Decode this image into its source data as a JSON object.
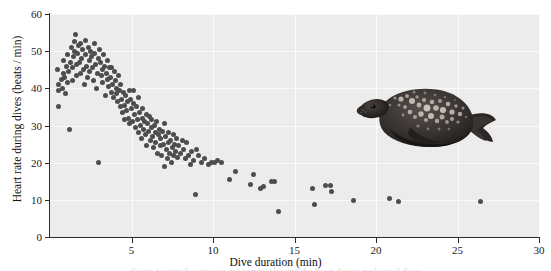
{
  "figure": {
    "title": "",
    "seal_alt": "weddell-seal-illustration",
    "caption_sliver": "diving mammals conserve oxygen by slowing the heart during prolonged dives"
  },
  "axes": {
    "x_title": "Dive duration (min)",
    "y_title": "Heart rate during dives (beats / min)",
    "x_ticks": [
      "5",
      "10",
      "15",
      "20",
      "25",
      "30"
    ],
    "y_ticks": [
      "60",
      "50",
      "40",
      "30",
      "20",
      "10",
      "0"
    ]
  },
  "colors": {
    "panel_background": "#ececec",
    "gridline": "#fafafa",
    "point": "#4d4d4d",
    "axis": "#2b2b2b",
    "text": "#1a1a1a",
    "page_background": "#ffffff"
  },
  "chart_data": {
    "type": "scatter",
    "title": "",
    "xlabel": "Dive duration (min)",
    "ylabel": "Heart rate during dives (beats / min)",
    "xlim": [
      0,
      30
    ],
    "ylim": [
      0,
      60
    ],
    "xticks": [
      5,
      10,
      15,
      20,
      25,
      30
    ],
    "yticks": [
      0,
      10,
      20,
      30,
      40,
      50,
      60
    ],
    "grid": true,
    "legend": null,
    "marker": {
      "shape": "circle",
      "color": "#4d4d4d",
      "size": 5
    },
    "series": [
      {
        "name": "Weddell seal dives",
        "points": [
          [
            0.45,
            45.0
          ],
          [
            0.5,
            39.5
          ],
          [
            0.55,
            41.0
          ],
          [
            0.5,
            35.0
          ],
          [
            0.7,
            42.5
          ],
          [
            0.75,
            40.0
          ],
          [
            0.8,
            44.0
          ],
          [
            0.85,
            47.5
          ],
          [
            0.9,
            43.0
          ],
          [
            0.95,
            38.5
          ],
          [
            1.0,
            46.0
          ],
          [
            1.05,
            41.5
          ],
          [
            1.1,
            49.0
          ],
          [
            1.15,
            44.5
          ],
          [
            1.2,
            29.0
          ],
          [
            1.25,
            47.0
          ],
          [
            1.3,
            51.0
          ],
          [
            1.35,
            45.5
          ],
          [
            1.4,
            42.0
          ],
          [
            1.45,
            48.5
          ],
          [
            1.5,
            52.5
          ],
          [
            1.52,
            50.0
          ],
          [
            1.55,
            54.5
          ],
          [
            1.6,
            46.5
          ],
          [
            1.65,
            43.5
          ],
          [
            1.7,
            49.5
          ],
          [
            1.75,
            51.5
          ],
          [
            1.8,
            47.0
          ],
          [
            1.85,
            44.0
          ],
          [
            1.9,
            52.0
          ],
          [
            1.95,
            48.0
          ],
          [
            2.0,
            50.5
          ],
          [
            2.05,
            45.0
          ],
          [
            2.1,
            41.0
          ],
          [
            2.15,
            53.0
          ],
          [
            2.2,
            49.0
          ],
          [
            2.25,
            46.0
          ],
          [
            2.3,
            43.0
          ],
          [
            2.35,
            51.0
          ],
          [
            2.4,
            47.5
          ],
          [
            2.45,
            44.5
          ],
          [
            2.5,
            50.0
          ],
          [
            2.55,
            48.5
          ],
          [
            2.6,
            45.5
          ],
          [
            2.65,
            42.0
          ],
          [
            2.7,
            52.0
          ],
          [
            2.75,
            49.5
          ],
          [
            2.8,
            46.5
          ],
          [
            2.85,
            40.0
          ],
          [
            2.9,
            44.0
          ],
          [
            2.95,
            48.0
          ],
          [
            3.0,
            20.0
          ],
          [
            3.05,
            50.5
          ],
          [
            3.1,
            47.0
          ],
          [
            3.15,
            43.5
          ],
          [
            3.2,
            45.0
          ],
          [
            3.25,
            41.5
          ],
          [
            3.3,
            49.0
          ],
          [
            3.35,
            46.0
          ],
          [
            3.4,
            38.0
          ],
          [
            3.45,
            44.0
          ],
          [
            3.5,
            42.5
          ],
          [
            3.55,
            47.5
          ],
          [
            3.6,
            40.5
          ],
          [
            3.65,
            45.5
          ],
          [
            3.7,
            43.0
          ],
          [
            3.75,
            39.0
          ],
          [
            3.8,
            45.5
          ],
          [
            3.85,
            41.0
          ],
          [
            3.9,
            37.5
          ],
          [
            3.95,
            44.5
          ],
          [
            4.0,
            42.0
          ],
          [
            4.05,
            38.5
          ],
          [
            4.1,
            40.0
          ],
          [
            4.15,
            36.5
          ],
          [
            4.2,
            43.5
          ],
          [
            4.25,
            39.5
          ],
          [
            4.3,
            35.0
          ],
          [
            4.35,
            41.0
          ],
          [
            4.4,
            37.0
          ],
          [
            4.45,
            33.5
          ],
          [
            4.5,
            39.0
          ],
          [
            4.55,
            35.5
          ],
          [
            4.6,
            31.5
          ],
          [
            4.65,
            38.0
          ],
          [
            4.7,
            34.0
          ],
          [
            4.75,
            36.5
          ],
          [
            4.8,
            32.0
          ],
          [
            4.85,
            39.5
          ],
          [
            4.9,
            30.5
          ],
          [
            4.95,
            37.0
          ],
          [
            5.0,
            34.5
          ],
          [
            5.05,
            31.0
          ],
          [
            5.1,
            39.5
          ],
          [
            5.15,
            36.0
          ],
          [
            5.2,
            33.0
          ],
          [
            5.25,
            29.5
          ],
          [
            5.3,
            35.0
          ],
          [
            5.35,
            31.5
          ],
          [
            5.4,
            37.5
          ],
          [
            5.45,
            28.0
          ],
          [
            5.5,
            33.5
          ],
          [
            5.55,
            30.0
          ],
          [
            5.6,
            26.5
          ],
          [
            5.65,
            32.0
          ],
          [
            5.7,
            34.5
          ],
          [
            5.75,
            29.0
          ],
          [
            5.8,
            31.0
          ],
          [
            5.85,
            27.5
          ],
          [
            5.9,
            33.0
          ],
          [
            5.95,
            24.5
          ],
          [
            6.0,
            30.5
          ],
          [
            6.05,
            28.5
          ],
          [
            6.1,
            32.5
          ],
          [
            6.15,
            26.0
          ],
          [
            6.2,
            29.5
          ],
          [
            6.25,
            31.5
          ],
          [
            6.3,
            27.0
          ],
          [
            6.35,
            24.0
          ],
          [
            6.4,
            30.0
          ],
          [
            6.45,
            28.0
          ],
          [
            6.5,
            25.5
          ],
          [
            6.55,
            31.0
          ],
          [
            6.6,
            22.5
          ],
          [
            6.65,
            27.5
          ],
          [
            6.7,
            29.0
          ],
          [
            6.75,
            24.5
          ],
          [
            6.8,
            26.5
          ],
          [
            6.85,
            22.0
          ],
          [
            6.9,
            28.5
          ],
          [
            6.95,
            25.0
          ],
          [
            7.0,
            30.5
          ],
          [
            7.05,
            19.0
          ],
          [
            7.1,
            27.0
          ],
          [
            7.15,
            23.5
          ],
          [
            7.2,
            21.0
          ],
          [
            7.25,
            25.5
          ],
          [
            7.3,
            28.0
          ],
          [
            7.35,
            22.5
          ],
          [
            7.4,
            26.0
          ],
          [
            7.45,
            20.0
          ],
          [
            7.5,
            24.0
          ],
          [
            7.55,
            27.5
          ],
          [
            7.6,
            22.0
          ],
          [
            7.65,
            25.0
          ],
          [
            7.7,
            23.0
          ],
          [
            7.75,
            26.5
          ],
          [
            7.8,
            21.5
          ],
          [
            7.9,
            24.5
          ],
          [
            8.0,
            22.5
          ],
          [
            8.1,
            26.0
          ],
          [
            8.2,
            23.5
          ],
          [
            8.3,
            21.0
          ],
          [
            8.4,
            25.5
          ],
          [
            8.5,
            22.0
          ],
          [
            8.6,
            19.5
          ],
          [
            8.7,
            23.0
          ],
          [
            8.8,
            20.5
          ],
          [
            8.9,
            11.5
          ],
          [
            9.0,
            23.5
          ],
          [
            9.1,
            22.0
          ],
          [
            9.3,
            20.0
          ],
          [
            9.5,
            21.0
          ],
          [
            9.7,
            19.5
          ],
          [
            9.9,
            20.0
          ],
          [
            10.1,
            20.0
          ],
          [
            10.3,
            20.5
          ],
          [
            10.5,
            20.0
          ],
          [
            11.0,
            15.5
          ],
          [
            11.4,
            17.5
          ],
          [
            12.3,
            14.0
          ],
          [
            12.5,
            16.8
          ],
          [
            12.9,
            13.0
          ],
          [
            13.1,
            13.5
          ],
          [
            13.6,
            14.8
          ],
          [
            13.8,
            15.0
          ],
          [
            14.0,
            6.8
          ],
          [
            16.1,
            13.0
          ],
          [
            16.2,
            8.8
          ],
          [
            16.9,
            13.8
          ],
          [
            17.2,
            13.8
          ],
          [
            17.3,
            12.2
          ],
          [
            18.6,
            9.7
          ],
          [
            20.8,
            10.3
          ],
          [
            21.4,
            9.5
          ],
          [
            26.4,
            9.5
          ]
        ]
      }
    ]
  }
}
